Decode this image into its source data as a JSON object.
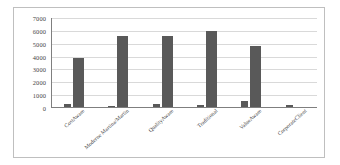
{
  "chart_data": {
    "type": "bar",
    "title": "",
    "xlabel": "",
    "ylabel": "",
    "ylim": [
      0,
      7000
    ],
    "ytick_values": [
      0,
      1000,
      2000,
      3000,
      4000,
      5000,
      6000,
      7000
    ],
    "ytick_labels": [
      "0",
      "1000",
      "2000",
      "3000",
      "4000",
      "5000",
      "6000",
      "7000"
    ],
    "grid": true,
    "legend": "none",
    "categories": [
      "CostAware",
      "Moderne Martina/Martin",
      "QualityAware",
      "Traditional",
      "ValueAware",
      "CorporateClient"
    ],
    "series": [
      {
        "name": "Series 1",
        "color": "#595959",
        "values": [
          200,
          90,
          220,
          140,
          440,
          180
        ]
      },
      {
        "name": "Series 2",
        "color": "#595959",
        "values": [
          3800,
          5560,
          5510,
          5950,
          4750,
          0
        ]
      }
    ]
  },
  "style": {
    "bar_color": "#595959",
    "gridline_color": "#d9d9d9",
    "axis_color": "#7f7f7f",
    "border_color": "#bfbfbf",
    "text_color": "#3f3f3f",
    "background": "#ffffff"
  }
}
